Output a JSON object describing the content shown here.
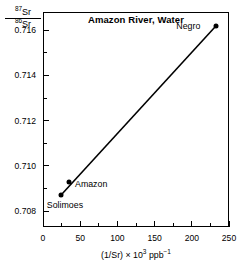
{
  "chart_data": {
    "type": "scatter",
    "title": "Amazon River, Water",
    "xlabel": "(1/Sr) × 10³ ppb⁻¹",
    "ylabel": "87Sr/86Sr",
    "ylabel_numerator": "Sr",
    "ylabel_numerator_sup": "87",
    "ylabel_denominator": "Sr",
    "ylabel_denominator_sup": "86",
    "xlim": [
      0,
      250
    ],
    "ylim": [
      0.7073,
      0.7168
    ],
    "grid": false,
    "legend": "none",
    "xticks": [
      0,
      50,
      100,
      150,
      200,
      250
    ],
    "xticks_minor": [
      25,
      75,
      125,
      175,
      225
    ],
    "yticks": [
      0.708,
      0.71,
      0.712,
      0.714,
      0.716
    ],
    "ytick_labels": [
      "0.708",
      "0.710",
      "0.712",
      "0.714",
      "0.716"
    ],
    "yticks_minor": [
      0.709,
      0.711,
      0.713,
      0.715
    ],
    "points": [
      {
        "name": "Solimoes",
        "x": 24,
        "y": 0.7087,
        "label": "Solimoes",
        "label_pos": "below-left"
      },
      {
        "name": "Amazon",
        "x": 35,
        "y": 0.7093,
        "label": "Amazon",
        "label_pos": "right"
      },
      {
        "name": "Negro",
        "x": 233,
        "y": 0.7162,
        "label": "Negro",
        "label_pos": "left"
      }
    ],
    "mixing_line": {
      "x1": 24,
      "y1": 0.7087,
      "x2": 233,
      "y2": 0.7162,
      "style": "solid"
    },
    "colors": {
      "ink": "#000000",
      "background": "#ffffff"
    }
  },
  "axis_labels": {
    "x_prefix": "(1/Sr) × 10",
    "x_exponent": "3",
    "x_suffix": " ppb",
    "x_suffix_exponent": "−1"
  }
}
